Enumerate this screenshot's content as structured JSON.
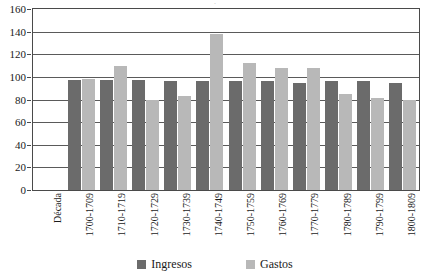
{
  "chart_data": {
    "type": "bar",
    "title": "",
    "xlabel": "",
    "ylabel": "",
    "ylim": [
      0,
      160
    ],
    "ytick_step": 20,
    "yticks": [
      0,
      20,
      40,
      60,
      80,
      100,
      120,
      140,
      160
    ],
    "grid": "horizontal",
    "legend_position": "bottom",
    "axis_category_label": "Década",
    "categories": [
      "Década",
      "1700-1709",
      "1710-1719",
      "1720-1729",
      "1730-1739",
      "1740-1749",
      "1750-1759",
      "1760-1769",
      "1770-1779",
      "1780-1789",
      "1790-1799",
      "1800-1809"
    ],
    "series": [
      {
        "name": "Ingresos",
        "color": "#6b6b6b",
        "values": [
          null,
          97,
          97,
          97,
          96,
          96,
          96,
          96,
          95,
          96,
          96,
          95
        ]
      },
      {
        "name": "Gastos",
        "color": "#b8b8b8",
        "values": [
          null,
          98,
          110,
          80,
          83,
          138,
          112,
          108,
          108,
          85,
          81,
          80
        ]
      }
    ]
  },
  "legend": {
    "items": [
      {
        "label": "Ingresos",
        "color": "#6b6b6b"
      },
      {
        "label": "Gastos",
        "color": "#b8b8b8"
      }
    ]
  },
  "title_sliver": "·"
}
